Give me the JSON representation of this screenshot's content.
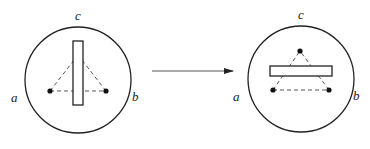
{
  "diagram": {
    "type": "before-after transformation",
    "colors": {
      "stroke": "#222222",
      "dash": "#444444",
      "background": "#ffffff"
    },
    "panels": [
      {
        "id": "before",
        "circle": {
          "cx": 78,
          "cy": 80,
          "r": 53
        },
        "labels": {
          "a": {
            "text": "a",
            "x": 11,
            "y": 91
          },
          "b": {
            "text": "b",
            "x": 132,
            "y": 90
          },
          "c": {
            "text": "c",
            "x": 75,
            "y": 9
          }
        },
        "bar": {
          "x": 73,
          "y": 41,
          "width": 10,
          "height": 64,
          "orientation": "vertical"
        },
        "dots": [
          {
            "name": "left",
            "x": 50,
            "y": 91
          },
          {
            "name": "right",
            "x": 106,
            "y": 91
          }
        ],
        "apex_hidden": {
          "x": 78,
          "y": 55
        }
      },
      {
        "id": "after",
        "circle": {
          "cx": 301,
          "cy": 79,
          "r": 53
        },
        "labels": {
          "a": {
            "text": "a",
            "x": 233,
            "y": 90
          },
          "b": {
            "text": "b",
            "x": 353,
            "y": 89
          },
          "c": {
            "text": "c",
            "x": 298,
            "y": 8
          }
        },
        "bar": {
          "x": 270,
          "y": 66,
          "width": 62,
          "height": 10,
          "orientation": "horizontal"
        },
        "dots": [
          {
            "name": "top",
            "x": 300,
            "y": 51
          },
          {
            "name": "left",
            "x": 273,
            "y": 90
          },
          {
            "name": "right",
            "x": 329,
            "y": 90
          }
        ]
      }
    ],
    "arrow": {
      "x1": 152,
      "y1": 71,
      "x2": 233,
      "y2": 71,
      "direction": "right"
    }
  }
}
